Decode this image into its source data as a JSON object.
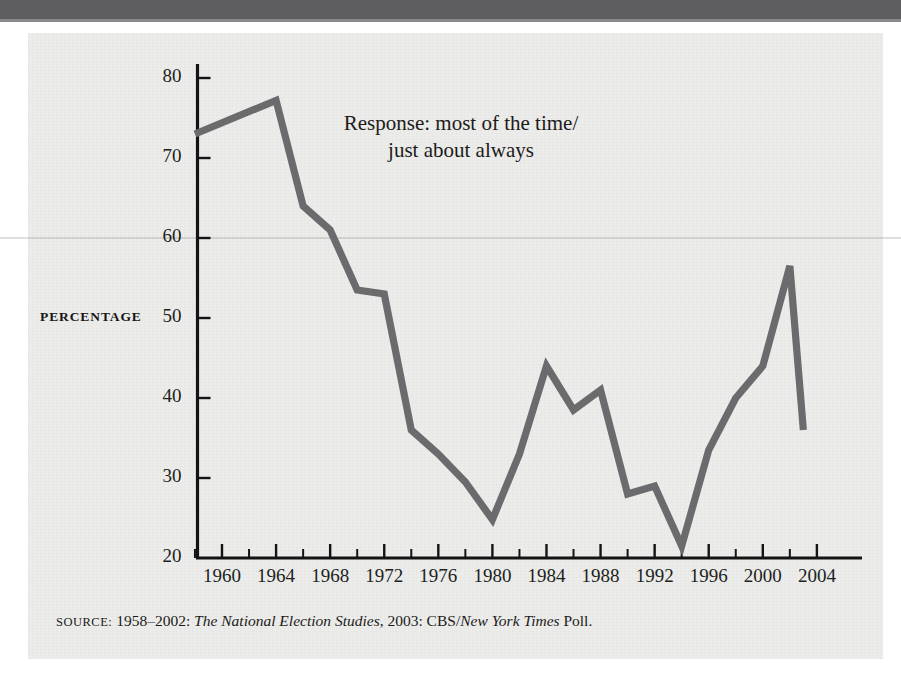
{
  "figure": {
    "annotation_line1": "Response: most of the time/",
    "annotation_line2": "just about always",
    "axis_label_y": "PERCENTAGE",
    "source_prefix": "SOURCE:",
    "source_years": " 1958–2002: ",
    "source_study": "The National Election Studies",
    "source_mid": ", 2003: CBS/",
    "source_paper": "New York Times",
    "source_suffix": " Poll.",
    "line_color": "#6b6b6d",
    "axis_color": "#141414",
    "panel_color": "#ececea",
    "topbar_color": "#5e5e60"
  },
  "chart_data": {
    "type": "line",
    "title": "",
    "subtitle": "",
    "xlabel": "",
    "ylabel": "PERCENTAGE",
    "xlim": [
      1958,
      2003
    ],
    "ylim": [
      20,
      80
    ],
    "yticks": [
      20,
      30,
      40,
      50,
      60,
      70,
      80
    ],
    "yticklabels": [
      "20",
      "30",
      "40",
      "50",
      "60",
      "70",
      "80"
    ],
    "xticks": [
      1960,
      1964,
      1968,
      1972,
      1976,
      1980,
      1984,
      1988,
      1992,
      1996,
      2000,
      2004
    ],
    "xticklabels": [
      "1960",
      "1964",
      "1968",
      "1972",
      "1976",
      "1980",
      "1984",
      "1988",
      "1992",
      "1996",
      "2000",
      "2004"
    ],
    "xminorticks": [
      1958,
      1962,
      1966,
      1970,
      1974,
      1978,
      1982,
      1986,
      1990,
      1994,
      1998,
      2002
    ],
    "grid": false,
    "legend": null,
    "annotations": [
      {
        "text": "Response: most of the time/ just about always",
        "x": 1969,
        "y": 71
      }
    ],
    "series": [
      {
        "name": "Trust the government to do what is right most of the time / just about always",
        "color": "#6b6b6d",
        "x": [
          1958,
          1964,
          1966,
          1968,
          1970,
          1972,
          1974,
          1976,
          1978,
          1980,
          1982,
          1984,
          1986,
          1988,
          1990,
          1992,
          1994,
          1996,
          1998,
          2000,
          2002,
          2003
        ],
        "values": [
          73.0,
          77.2,
          64.0,
          61.0,
          53.5,
          53.0,
          36.0,
          33.0,
          29.5,
          24.8,
          33.0,
          44.0,
          38.5,
          41.0,
          28.0,
          29.0,
          21.5,
          33.5,
          40.0,
          44.0,
          56.5,
          36.0
        ]
      }
    ]
  }
}
